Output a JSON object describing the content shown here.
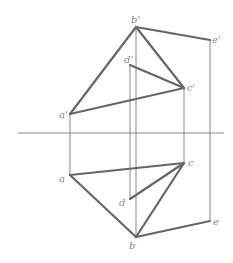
{
  "diagram": {
    "type": "orthographic-projection",
    "colors": {
      "thick": "#666666",
      "thin": "#888888",
      "label": "#888888",
      "background": "#ffffff"
    },
    "axis": {
      "x1": 18,
      "x2": 224,
      "y": 133
    },
    "points": {
      "b_prime": {
        "label": "b'",
        "x": 136,
        "y": 27,
        "lx": 131,
        "ly": 23
      },
      "e_prime": {
        "label": "e'",
        "x": 210,
        "y": 40,
        "lx": 212,
        "ly": 43
      },
      "d_prime": {
        "label": "d'",
        "x": 130,
        "y": 65,
        "lx": 124,
        "ly": 63
      },
      "c_prime": {
        "label": "c'",
        "x": 184,
        "y": 88,
        "lx": 187,
        "ly": 91
      },
      "a_prime": {
        "label": "a'",
        "x": 70,
        "y": 114,
        "lx": 59,
        "ly": 118
      },
      "a": {
        "label": "a",
        "x": 70,
        "y": 175,
        "lx": 59,
        "ly": 182
      },
      "c": {
        "label": "c",
        "x": 184,
        "y": 163,
        "lx": 188,
        "ly": 166
      },
      "d": {
        "label": "d",
        "x": 130,
        "y": 199,
        "lx": 119,
        "ly": 206
      },
      "b": {
        "label": "b",
        "x": 136,
        "y": 237,
        "lx": 129,
        "ly": 249
      },
      "e": {
        "label": "e",
        "x": 210,
        "y": 221,
        "lx": 213,
        "ly": 225
      }
    }
  }
}
